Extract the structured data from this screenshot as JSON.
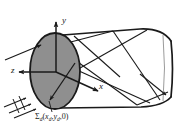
{
  "figure": {
    "kind": "optical-waveguide-ray-diagram",
    "background_color": "#ffffff",
    "line_color": "#1a1a1a",
    "aperture_fill_color": "#8f8f8f",
    "aperture_edge_color": "#1a1a1a",
    "width": 184,
    "height": 138
  },
  "axes": {
    "y": {
      "label": "y"
    },
    "z": {
      "label": "z"
    },
    "x": {
      "label": "x"
    }
  },
  "annotations": {
    "source": {
      "sigma": "Σ",
      "sigma_subscript": "d",
      "open_paren": "(",
      "x_symbol": "x",
      "x_subscript": "d",
      "comma1": ",",
      "y_symbol": "y",
      "y_subscript": "d",
      "comma2": ",",
      "zero": "0",
      "close_paren": ")",
      "full_text": "Σd(xd, yd, 0)"
    }
  },
  "elements": {
    "aperture_disk": "entrance-aperture-ellipse",
    "cylinder_body": "light-guide-body",
    "incoming_beam": "incident-ray-bundle",
    "internal_rays": "internally-reflected-rays",
    "exit_ray": "exit-ray"
  }
}
